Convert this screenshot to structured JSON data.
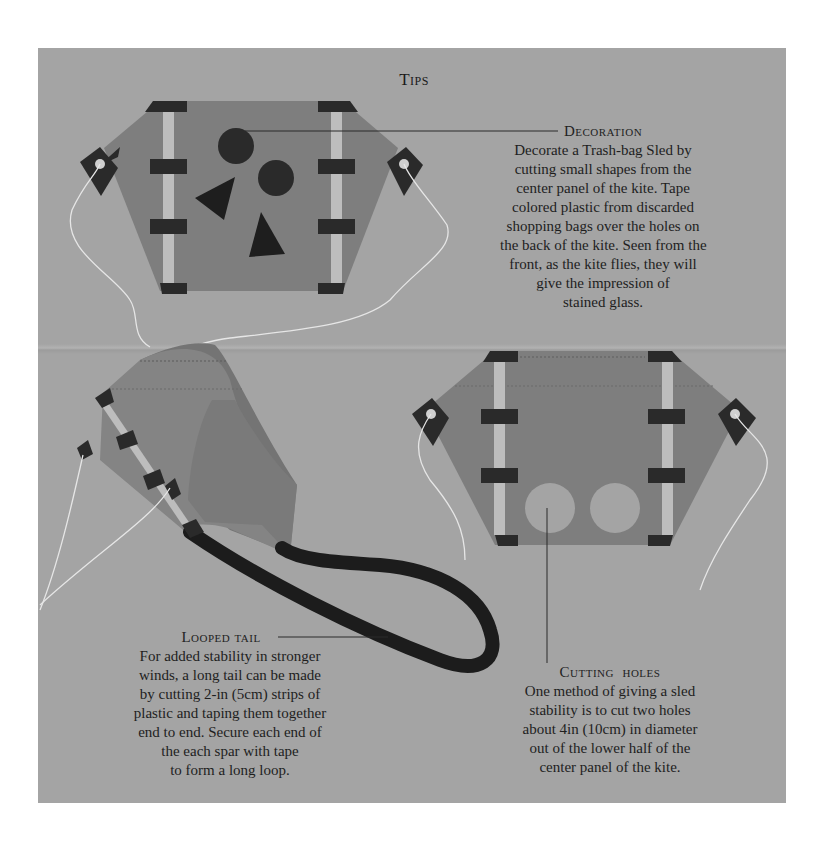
{
  "page": {
    "title": "Tips",
    "background_color": "#a4a4a4",
    "kite_color": "#7e7e7e",
    "tape_color": "#2a2a2a",
    "spar_color": "#bdbdbd"
  },
  "sections": {
    "decoration": {
      "heading": "Decoration",
      "lines": [
        "Decorate a Trash-bag Sled by",
        "cutting small shapes from the",
        "center panel of the kite. Tape",
        "colored plastic from discarded",
        "shopping bags over the holes on",
        "the back of the kite. Seen from the",
        "front, as the kite flies, they will",
        "give the impression of",
        "stained glass."
      ]
    },
    "looped_tail": {
      "heading": "Looped tail",
      "lines": [
        "For added stability in stronger",
        "winds, a long tail can be made",
        "by cutting 2-in (5cm) strips of",
        "plastic and taping them together",
        "end to end. Secure each end of",
        "the each spar with tape",
        "to form a long loop."
      ]
    },
    "cutting_holes": {
      "heading": "Cutting  holes",
      "lines": [
        "One method of giving a sled",
        "stability is to cut two holes",
        "about 4in (10cm) in diameter",
        "out of the lower half of the",
        "center panel of the kite."
      ]
    }
  }
}
